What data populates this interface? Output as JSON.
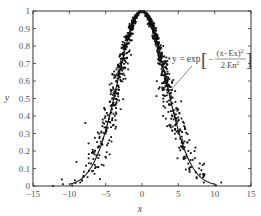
{
  "chart_data": {
    "type": "scatter",
    "title": "",
    "xlabel": "x",
    "ylabel": "y",
    "xlim": [
      -15,
      15
    ],
    "ylim": [
      0,
      1
    ],
    "xticks": [
      -15,
      -10,
      -5,
      0,
      5,
      10,
      15
    ],
    "xtick_labels": [
      "-15",
      "-10",
      "-5",
      "0",
      "5",
      "10",
      "15"
    ],
    "yticks": [
      0,
      0.1,
      0.2,
      0.3,
      0.4,
      0.5,
      0.6,
      0.7,
      0.8,
      0.9,
      1
    ],
    "ytick_labels": [
      "0",
      "0.1",
      "0.2",
      "0.3",
      "0.4",
      "0.5",
      "0.6",
      "0.7",
      "0.8",
      "0.9",
      "1"
    ],
    "grid": false,
    "legend": null,
    "series": [
      {
        "name": "cloud drops",
        "kind": "scatter",
        "description": "Cloud-model drops scattered around the expectation curve; dense near the peak, sparser in the tails",
        "approx_count": 1000,
        "x_range": [
          -11,
          11
        ],
        "sample_points": [
          [
            -10.9,
            0.01
          ],
          [
            -8.5,
            0.02
          ],
          [
            -7.5,
            0.05
          ],
          [
            -6.5,
            0.12
          ],
          [
            -6,
            0.16
          ],
          [
            -5.5,
            0.24
          ],
          [
            -5,
            0.3
          ],
          [
            -4.5,
            0.4
          ],
          [
            -4,
            0.5
          ],
          [
            -3.5,
            0.6
          ],
          [
            -3,
            0.7
          ],
          [
            -2.5,
            0.78
          ],
          [
            -2,
            0.85
          ],
          [
            -1.5,
            0.91
          ],
          [
            -1,
            0.96
          ],
          [
            0,
            1.0
          ],
          [
            1,
            0.96
          ],
          [
            1.5,
            0.91
          ],
          [
            2,
            0.85
          ],
          [
            2.5,
            0.78
          ],
          [
            3,
            0.7
          ],
          [
            3.5,
            0.6
          ],
          [
            4,
            0.5
          ],
          [
            4.5,
            0.4
          ],
          [
            5,
            0.3
          ],
          [
            5.5,
            0.22
          ],
          [
            6,
            0.16
          ],
          [
            6.5,
            0.1
          ],
          [
            7.5,
            0.05
          ],
          [
            8.5,
            0.02
          ],
          [
            10.9,
            0.02
          ],
          [
            -7.8,
            0.36
          ],
          [
            -3.2,
            0.55
          ],
          [
            2.9,
            0.4
          ],
          [
            4.6,
            0.48
          ],
          [
            -1.5,
            0.75
          ]
        ]
      },
      {
        "name": "expectation curve",
        "kind": "line",
        "formula": "y = exp[-(x-Ex)^2 / (2 En^2)]",
        "Ex": 0,
        "En": 3.3
      }
    ],
    "annotations": [
      {
        "text": "y = exp[ -(x-Ex)^2 / (2 En^2) ]",
        "lhs": "y = exp",
        "numerator": "(x−Ex)",
        "numerator_exp": "2",
        "denominator": "2 En",
        "denominator_exp": "2",
        "sign": "−",
        "points_to": [
          3.8,
          0.55
        ]
      }
    ]
  },
  "labels": {
    "x_axis": "x",
    "y_axis": "y"
  }
}
